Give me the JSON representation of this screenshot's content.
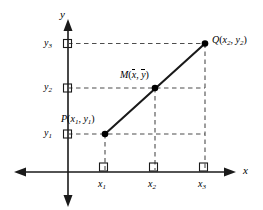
{
  "figure": {
    "kind": "coordinate-geometry-diagram",
    "stroke_color": "#1a1a1a",
    "dash_color": "#4d4d4d",
    "background": "#ffffff"
  },
  "axes": {
    "x_label": "x",
    "y_label": "y",
    "x_ticks": [
      {
        "id": "x1",
        "base": "x",
        "sub": "1"
      },
      {
        "id": "x2",
        "base": "x",
        "sub": "2"
      },
      {
        "id": "x3",
        "base": "x",
        "sub": "3"
      }
    ],
    "y_ticks": [
      {
        "id": "y3",
        "base": "y",
        "sub": "3"
      },
      {
        "id": "y2",
        "base": "y",
        "sub": "2"
      },
      {
        "id": "y1",
        "base": "y",
        "sub": "1"
      }
    ]
  },
  "points": [
    {
      "id": "P",
      "name": "P",
      "coord_x": {
        "base": "x",
        "sub": "1"
      },
      "coord_y": {
        "base": "y",
        "sub": "1"
      },
      "label": "P(x1, y1)"
    },
    {
      "id": "M",
      "name": "M",
      "coord_x": {
        "base": "x",
        "sub": "",
        "bar": true
      },
      "coord_y": {
        "base": "y",
        "sub": "",
        "bar": true
      },
      "label": "M(x̄, ȳ)"
    },
    {
      "id": "Q",
      "name": "Q",
      "coord_x": {
        "base": "x",
        "sub": "2"
      },
      "coord_y": {
        "base": "y",
        "sub": "2"
      },
      "label": "Q(x2, y2)"
    }
  ]
}
